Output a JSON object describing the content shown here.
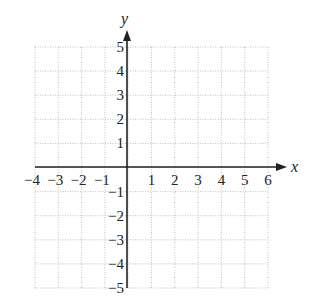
{
  "chart_data": {
    "type": "coordinate-grid",
    "title": "",
    "xlabel": "x",
    "ylabel": "y",
    "xlim": [
      -4,
      6
    ],
    "ylim": [
      -5,
      5
    ],
    "x_ticks": [
      -4,
      -3,
      -2,
      -1,
      1,
      2,
      3,
      4,
      5,
      6
    ],
    "x_tick_labels": [
      "−4",
      "−3",
      "−2",
      "−1",
      "1",
      "2",
      "3",
      "4",
      "5",
      "6"
    ],
    "y_ticks": [
      5,
      4,
      3,
      2,
      1,
      -1,
      -2,
      -3,
      -4,
      -5
    ],
    "y_tick_labels": [
      "5",
      "4",
      "3",
      "2",
      "1",
      "−1",
      "−2",
      "−3",
      "−4",
      "−5"
    ],
    "grid": true,
    "grid_style": "dotted",
    "series": [],
    "colors": {
      "axis": "#222222",
      "grid": "#b0b0b0",
      "background": "#ffffff"
    }
  },
  "axes": {
    "x_label": "x",
    "y_label": "y"
  }
}
